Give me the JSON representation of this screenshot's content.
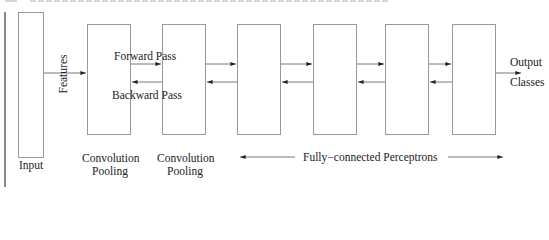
{
  "diagram": {
    "nodes": [
      {
        "id": "input",
        "label": "Input"
      },
      {
        "id": "conv1",
        "label_line1": "Convolution",
        "label_line2": "Pooling"
      },
      {
        "id": "conv2",
        "label_line1": "Convolution",
        "label_line2": "Pooling"
      },
      {
        "id": "fc1",
        "label": ""
      },
      {
        "id": "fc2",
        "label": ""
      },
      {
        "id": "fc3",
        "label": ""
      },
      {
        "id": "fc4",
        "label": ""
      }
    ],
    "edges": [
      {
        "from": "input",
        "to": "conv1",
        "label": "Features",
        "direction": "forward"
      },
      {
        "from": "conv1",
        "to": "conv2",
        "direction": "forward"
      },
      {
        "from": "conv2",
        "to": "conv1",
        "direction": "backward"
      },
      {
        "from": "conv2",
        "to": "fc1",
        "direction": "forward"
      },
      {
        "from": "fc1",
        "to": "conv2",
        "direction": "backward"
      },
      {
        "from": "fc1",
        "to": "fc2",
        "direction": "forward"
      },
      {
        "from": "fc2",
        "to": "fc1",
        "direction": "backward"
      },
      {
        "from": "fc2",
        "to": "fc3",
        "direction": "forward"
      },
      {
        "from": "fc3",
        "to": "fc2",
        "direction": "backward"
      },
      {
        "from": "fc3",
        "to": "fc4",
        "direction": "forward"
      },
      {
        "from": "fc4",
        "to": "fc3",
        "direction": "backward"
      },
      {
        "from": "fc4",
        "to": "output",
        "label": "Output Classes",
        "direction": "forward"
      }
    ],
    "labels": {
      "features": "Features",
      "forward_pass": "Forward Pass",
      "backward_pass": "Backward Pass",
      "output_line1": "Output",
      "output_line2": "Classes",
      "input": "Input",
      "conv1_line1": "Convolution",
      "conv1_line2": "Pooling",
      "conv2_line1": "Convolution",
      "conv2_line2": "Pooling",
      "fully_connected": "Fully−connected Perceptrons"
    },
    "colors": {
      "box_border": "#999999",
      "arrow": "#333333",
      "text": "#222222"
    }
  }
}
